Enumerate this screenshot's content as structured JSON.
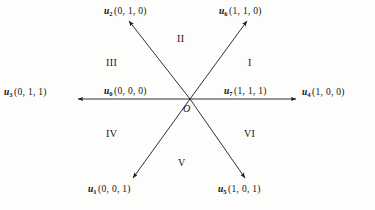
{
  "figure": {
    "type": "vector-sector-diagram",
    "origin_label": "O",
    "background_color": "#fdfdfb",
    "line_color": "#1a1a1a"
  },
  "vectors": [
    {
      "id": "u0",
      "name": "u",
      "subscript": "0",
      "coords": "(0, 0, 0)",
      "direction": "left",
      "label_x": 104,
      "label_y": 88
    },
    {
      "id": "u1",
      "name": "u",
      "subscript": "1",
      "coords": "(0, 0, 1)",
      "direction": "lower-left",
      "label_x": 88,
      "label_y": 185
    },
    {
      "id": "u2",
      "name": "u",
      "subscript": "2",
      "coords": "(0, 1, 0)",
      "direction": "upper-left",
      "label_x": 104,
      "label_y": 7
    },
    {
      "id": "u3",
      "name": "u",
      "subscript": "3",
      "coords": "(0, 1, 1)",
      "direction": "left",
      "label_x": 4,
      "label_y": 88
    },
    {
      "id": "u4",
      "name": "u",
      "subscript": "4",
      "coords": "(1, 0, 0)",
      "direction": "right",
      "label_x": 302,
      "label_y": 88
    },
    {
      "id": "u5",
      "name": "u",
      "subscript": "5",
      "coords": "(1, 0, 1)",
      "direction": "lower-right",
      "label_x": 218,
      "label_y": 185
    },
    {
      "id": "u6",
      "name": "u",
      "subscript": "6",
      "coords": "(1, 1, 0)",
      "direction": "upper-right",
      "label_x": 219,
      "label_y": 7
    },
    {
      "id": "u7",
      "name": "u",
      "subscript": "7",
      "coords": "(1, 1, 1)",
      "direction": "right",
      "label_x": 224,
      "label_y": 88
    }
  ],
  "sectors": [
    {
      "id": "sector-1",
      "label": "I",
      "x": 248,
      "y": 57
    },
    {
      "id": "sector-2",
      "label": "II",
      "x": 177,
      "y": 33
    },
    {
      "id": "sector-3",
      "label": "III",
      "x": 106,
      "y": 57
    },
    {
      "id": "sector-4",
      "label": "IV",
      "x": 106,
      "y": 128
    },
    {
      "id": "sector-5",
      "label": "V",
      "x": 178,
      "y": 157
    },
    {
      "id": "sector-6",
      "label": "VI",
      "x": 244,
      "y": 128
    }
  ],
  "origin": {
    "label": "O",
    "x": 183,
    "y": 104
  }
}
